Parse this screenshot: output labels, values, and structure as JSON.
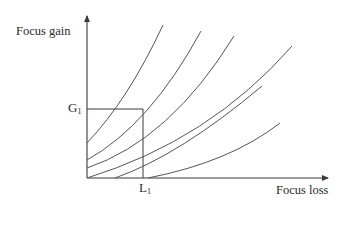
{
  "diagram": {
    "y_axis_label": "Focus gain",
    "x_axis_label": "Focus loss",
    "g_marker": {
      "base": "G",
      "sub": "1"
    },
    "l_marker": {
      "base": "L",
      "sub": "1"
    },
    "colors": {
      "axis": "#3a3a3a",
      "curve": "#555555",
      "text": "#2a2a2a"
    },
    "curves": [
      {
        "id": 1,
        "start": [
          87,
          143
        ],
        "end": [
          163,
          25
        ]
      },
      {
        "id": 2,
        "start": [
          87,
          160
        ],
        "end": [
          201,
          31
        ]
      },
      {
        "id": 3,
        "start": [
          87,
          168
        ],
        "end": [
          234,
          36
        ]
      },
      {
        "id": 4,
        "start": [
          87,
          178
        ],
        "end": [
          292,
          46
        ]
      },
      {
        "id": 5,
        "start": [
          115,
          178
        ],
        "end": [
          280,
          123
        ]
      },
      {
        "id": 6,
        "start": [
          148,
          178
        ],
        "end": [
          280,
          123
        ]
      }
    ]
  }
}
